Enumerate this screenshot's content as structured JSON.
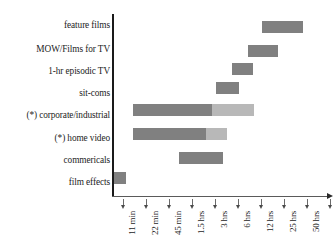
{
  "chart_data": {
    "type": "bar",
    "chart_subtype": "horizontal-range-bar",
    "title": "",
    "xlabel": "",
    "ylabel": "",
    "grid": false,
    "legend": "none",
    "x_axis": {
      "scale": "log-like-ordinal",
      "tick_labels": [
        "11 min",
        "22 min",
        "45 min",
        "1.5 hrs",
        "3 hrs",
        "6 hrs",
        "12 hrs",
        "25 hrs",
        "50 hrs",
        "100 hrs"
      ],
      "tick_values": [
        11,
        22,
        45,
        90,
        180,
        360,
        720,
        1500,
        3000,
        6000
      ],
      "tick_units": "minutes",
      "tick_positions_px": [
        123,
        146,
        169,
        192,
        215,
        238,
        261,
        284,
        307,
        330
      ]
    },
    "categories": [
      "feature films",
      "MOW/Films for TV",
      "1-hr episodic TV",
      "sit-coms",
      "(*) corporate/industrial",
      "(*) home video",
      "commericals",
      "film effects"
    ],
    "bars": [
      {
        "category": "feature films",
        "start_label": "25 hrs",
        "end_label": "80 hrs",
        "segments": [
          {
            "shade": "dark",
            "start_px": 262,
            "end_px": 303,
            "color": "#808080"
          }
        ]
      },
      {
        "category": "MOW/Films for TV",
        "start_label": "18 hrs",
        "end_label": "38 hrs",
        "segments": [
          {
            "shade": "dark",
            "start_px": 248,
            "end_px": 278,
            "color": "#808080"
          }
        ]
      },
      {
        "category": "1-hr episodic TV",
        "start_label": "9 hrs",
        "end_label": "17 hrs",
        "segments": [
          {
            "shade": "dark",
            "start_px": 232,
            "end_px": 253,
            "color": "#808080"
          }
        ]
      },
      {
        "category": "sit-coms",
        "start_label": "5 hrs",
        "end_label": "9 hrs",
        "segments": [
          {
            "shade": "dark",
            "start_px": 216,
            "end_px": 239,
            "color": "#808080"
          }
        ]
      },
      {
        "category": "(*) corporate/industrial",
        "start_label": "17 min",
        "end_label": "9 hrs",
        "segments": [
          {
            "shade": "dark",
            "start_px": 133,
            "end_px": 212,
            "color": "#808080"
          },
          {
            "shade": "light",
            "start_px": 212,
            "end_px": 254,
            "color": "#b8b8b8"
          }
        ]
      },
      {
        "category": "(*) home video",
        "start_label": "17 min",
        "end_label": "4 hrs",
        "segments": [
          {
            "shade": "dark",
            "start_px": 133,
            "end_px": 206,
            "color": "#808080"
          },
          {
            "shade": "light",
            "start_px": 206,
            "end_px": 227,
            "color": "#b8b8b8"
          }
        ]
      },
      {
        "category": "commericals",
        "start_label": "1.2 hrs",
        "end_label": "4 hrs",
        "segments": [
          {
            "shade": "dark",
            "start_px": 179,
            "end_px": 223,
            "color": "#808080"
          }
        ]
      },
      {
        "category": "film effects",
        "start_label": "0 min",
        "end_label": "10 min",
        "segments": [
          {
            "shade": "dark",
            "start_px": 114,
            "end_px": 126,
            "color": "#808080"
          }
        ]
      }
    ],
    "row_y_px": [
      21,
      45,
      63,
      82,
      104,
      128,
      152,
      172
    ],
    "colors": {
      "bar_dark": "#808080",
      "bar_light": "#b8b8b8",
      "axis": "#1a1a1a",
      "text": "#1d1d1d",
      "background": "#ffffff"
    }
  }
}
